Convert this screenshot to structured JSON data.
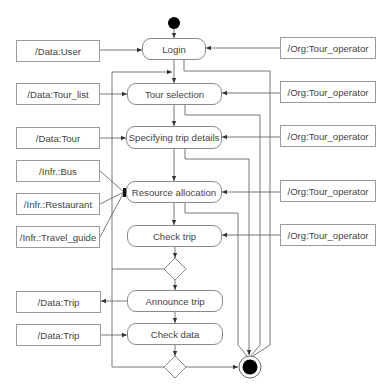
{
  "diagram": {
    "initial_node": "start",
    "final_node": "end",
    "activities": [
      {
        "id": "login",
        "label": "Login"
      },
      {
        "id": "tour_selection",
        "label": "Tour selection"
      },
      {
        "id": "specifying_trip_details",
        "label": "Specifying trip details"
      },
      {
        "id": "resource_allocation",
        "label": "Resource allocation"
      },
      {
        "id": "check_trip",
        "label": "Check trip"
      },
      {
        "id": "announce_trip",
        "label": "Announce trip"
      },
      {
        "id": "check_data",
        "label": "Check data"
      }
    ],
    "decisions": [
      {
        "id": "decision_after_check_trip"
      },
      {
        "id": "decision_after_check_data"
      }
    ],
    "left_objects": [
      {
        "label": "/Data:User",
        "target": "Login",
        "direction": "in"
      },
      {
        "label": "/Data:Tour_list",
        "target": "Tour selection",
        "direction": "in"
      },
      {
        "label": "/Data:Tour",
        "target": "Specifying trip details",
        "direction": "in"
      },
      {
        "label": "/Infr.:Bus",
        "target": "Resource allocation",
        "direction": "in"
      },
      {
        "label": "/Infr.:Restaurant",
        "target": "Resource allocation",
        "direction": "in"
      },
      {
        "label": "/Infr.:Travel_guide",
        "target": "Resource allocation",
        "direction": "in"
      },
      {
        "label": "/Data:Trip",
        "target": "Announce trip",
        "direction": "out"
      },
      {
        "label": "/Data:Trip",
        "target": "Check data",
        "direction": "in"
      }
    ],
    "right_objects": [
      {
        "label": "/Org:Tour_operator",
        "target": "Login"
      },
      {
        "label": "/Org:Tour_operator",
        "target": "Tour selection"
      },
      {
        "label": "/Org:Tour_operator",
        "target": "Specifying trip details"
      },
      {
        "label": "/Org:Tour_operator",
        "target": "Resource allocation"
      },
      {
        "label": "/Org:Tour_operator",
        "target": "Check trip"
      }
    ],
    "colors": {
      "line": "#6a6a6a",
      "border": "#8a8a8a",
      "text": "#444444",
      "node_fill": "#000000"
    }
  }
}
